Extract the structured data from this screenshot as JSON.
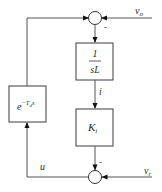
{
  "diagram": {
    "type": "block-diagram",
    "signals": {
      "vo": "v",
      "vo_sub": "o",
      "vr": "v",
      "vr_sub": "r",
      "i": "i",
      "u": "u"
    },
    "blocks": {
      "inductor": {
        "numerator": "1",
        "denominator": "sL"
      },
      "gain": {
        "symbol": "K",
        "sub": "i"
      },
      "delay": {
        "base": "e",
        "exponent": "−T",
        "exponent_sub": "d",
        "exponent_tail": "s"
      }
    },
    "junctions": {
      "top": {
        "sign_label": "-"
      },
      "bottom": {
        "sign_label": "-"
      }
    }
  }
}
